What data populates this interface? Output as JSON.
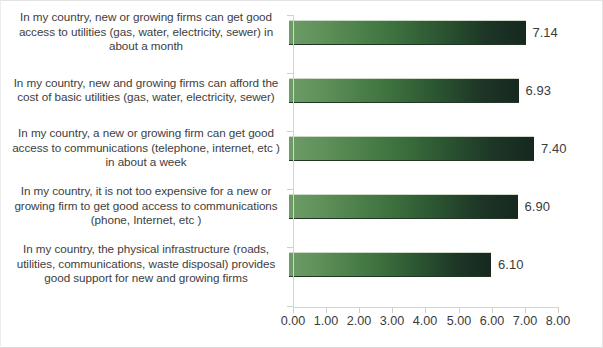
{
  "chart_data": {
    "type": "bar",
    "orientation": "horizontal",
    "title": "",
    "xlabel": "",
    "ylabel": "",
    "xlim": [
      0.0,
      8.0
    ],
    "xtick_step": 1.0,
    "xticks": [
      "0.00",
      "1.00",
      "2.00",
      "3.00",
      "4.00",
      "5.00",
      "6.00",
      "7.00",
      "8.00"
    ],
    "grid": false,
    "legend": "none",
    "bar_fill": "gradient-green",
    "bar_color_start": "#6e9c68",
    "bar_color_end": "#16281f",
    "categories": [
      "In my country, new or growing firms can get good access to utilities (gas, water, electricity, sewer) in about a month",
      "In my country, new and growing firms can afford the cost of basic utilities (gas, water, electricity, sewer)",
      "In my country, a new or growing firm can get good access to communications (telephone, internet, etc ) in about a week",
      "In my country, it is not too expensive for a new or growing firm to get good access to communications (phone, Internet, etc )",
      "In my country, the physical infrastructure (roads, utilities, communications, waste disposal) provides good support for new and growing firms"
    ],
    "values": [
      7.14,
      6.93,
      7.4,
      6.9,
      6.1
    ],
    "data_labels": [
      "7.14",
      "6.93",
      "7.40",
      "6.90",
      "6.10"
    ]
  }
}
